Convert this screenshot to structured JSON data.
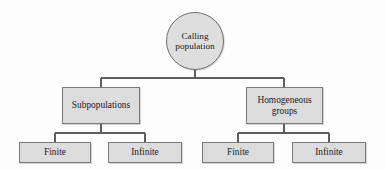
{
  "diagram": {
    "type": "hierarchy-tree",
    "background_color": "#fdfdfd",
    "node_fill_color": "#dcdcdc",
    "node_border_color": "#7a7a7a",
    "edge_color": "#5d5d5d",
    "text_color": "#1b1b1b"
  },
  "ghost_text": {
    "line1": "",
    "line2": ""
  },
  "nodes": {
    "root": {
      "label_line1": "Calling",
      "label_line2": "population",
      "shape": "circle"
    },
    "level2": [
      {
        "id": "subpopulations",
        "label_line1": "Subpopulations",
        "label_line2": "",
        "shape": "rectangle"
      },
      {
        "id": "homogeneous-groups",
        "label_line1": "Homogeneous",
        "label_line2": "groups",
        "shape": "rectangle"
      }
    ],
    "level3": [
      {
        "id": "sub-finite",
        "label": "Finite",
        "parent": "subpopulations"
      },
      {
        "id": "sub-infinite",
        "label": "Infinite",
        "parent": "subpopulations"
      },
      {
        "id": "hom-finite",
        "label": "Finite",
        "parent": "homogeneous-groups"
      },
      {
        "id": "hom-infinite",
        "label": "Infinite",
        "parent": "homogeneous-groups"
      }
    ]
  }
}
